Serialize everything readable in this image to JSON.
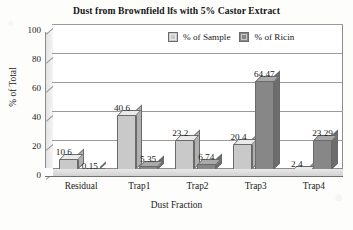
{
  "chart_data": {
    "type": "bar",
    "title": "Dust from Brownfield lfs with 5% Castor Extract",
    "xlabel": "Dust Fraction",
    "ylabel": "% of Total",
    "categories": [
      "Residual",
      "Trap1",
      "Trap2",
      "Trap3",
      "Trap4"
    ],
    "series": [
      {
        "name": "% of Sample",
        "color": "#c9c9c9",
        "values": [
          10.6,
          40.6,
          23.2,
          20.4,
          2.4
        ],
        "labels": [
          "10.6",
          "40.6",
          "23.2",
          "20.4",
          "2.4"
        ]
      },
      {
        "name": "% of Ricin",
        "color": "#878787",
        "values": [
          0.15,
          5.35,
          6.74,
          64.47,
          23.29
        ],
        "labels": [
          "0.15",
          "5.35",
          "6.74",
          "64.47",
          "23.29"
        ]
      }
    ],
    "ylim": [
      0,
      100
    ],
    "yticks": [
      "100",
      "80",
      "60",
      "40",
      "20",
      "0"
    ],
    "ytick_values": [
      100,
      80,
      60,
      40,
      20,
      0
    ],
    "grid": true,
    "legend_position": "top-right-inside",
    "style": "3d-bar"
  }
}
